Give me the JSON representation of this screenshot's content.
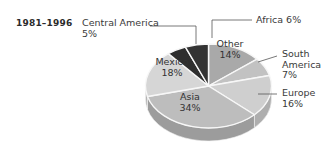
{
  "title": "1981–1996",
  "chart_data": {
    "type": "pie",
    "title": "1981–1996",
    "xlabel": "",
    "ylabel": "",
    "legend_position": "none",
    "grid": false,
    "unit": "%",
    "categories": [
      "Other",
      "South America",
      "Europe",
      "Asia",
      "Mexico",
      "Central America",
      "Africa"
    ],
    "values": [
      14,
      7,
      16,
      34,
      18,
      5,
      6
    ],
    "slices": [
      {
        "name": "Other",
        "value": 14,
        "label": "Other",
        "value_text": "14%",
        "color": "#a9a9a9",
        "side_color": "#8d8d8d",
        "start_deg": 0,
        "end_deg": 50.4,
        "label_placement": "inside"
      },
      {
        "name": "South America",
        "value": 7,
        "label": "South America",
        "value_text": "7%",
        "color": "#c2c2c2",
        "side_color": "#a2a2a2",
        "start_deg": 50.4,
        "end_deg": 75.6,
        "label_placement": "outside"
      },
      {
        "name": "Europe",
        "value": 16,
        "label": "Europe",
        "value_text": "16%",
        "color": "#cfcfcf",
        "side_color": "#aeaeae",
        "start_deg": 75.6,
        "end_deg": 133.2,
        "label_placement": "outside"
      },
      {
        "name": "Asia",
        "value": 34,
        "label": "Asia",
        "value_text": "34%",
        "color": "#bdbdbd",
        "side_color": "#9c9c9c",
        "start_deg": 133.2,
        "end_deg": 255.6,
        "label_placement": "inside"
      },
      {
        "name": "Mexico",
        "value": 18,
        "label": "Mexico",
        "value_text": "18%",
        "color": "#d6d6d6",
        "side_color": "#b4b4b4",
        "start_deg": 255.6,
        "end_deg": 320.4,
        "label_placement": "inside"
      },
      {
        "name": "Central America",
        "value": 5,
        "label": "Central America",
        "value_text": "5%",
        "color": "#2e2e2e",
        "side_color": "#242424",
        "start_deg": 320.4,
        "end_deg": 338.4,
        "label_placement": "outside"
      },
      {
        "name": "Africa",
        "value": 6,
        "label": "Africa",
        "value_text": "6%",
        "color": "#333333",
        "side_color": "#272727",
        "start_deg": 338.4,
        "end_deg": 360,
        "label_placement": "outside"
      }
    ]
  },
  "labels": {
    "central_america_name": "Central America",
    "central_america_value": "5%",
    "africa_text": "Africa  6%",
    "south_america_name": "South",
    "south_america_name2": "America",
    "south_america_value": "7%",
    "europe_name": "Europe",
    "europe_value": "16%",
    "other_name": "Other",
    "other_value": "14%",
    "asia_name": "Asia",
    "asia_value": "34%",
    "mexico_name": "Mexico",
    "mexico_value": "18%"
  }
}
